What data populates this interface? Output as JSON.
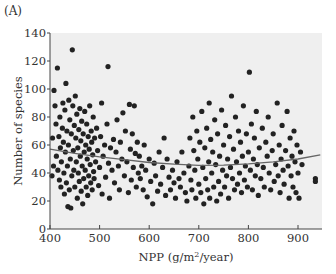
{
  "panel_label": "(A)",
  "chart_data": {
    "type": "scatter",
    "title": "",
    "xlabel": "NPP (g/m²/year)",
    "xlabel_parts": {
      "base": "NPP (g/m",
      "sup": "2",
      "rest": "/year)"
    },
    "ylabel": "Number of species",
    "xlim": [
      400,
      950
    ],
    "ylim": [
      0,
      140
    ],
    "xticks": [
      400,
      500,
      600,
      700,
      800,
      900
    ],
    "yticks": [
      0,
      20,
      40,
      60,
      80,
      100,
      120,
      140
    ],
    "grid": false,
    "legend": null,
    "plot_background": "#efefef",
    "point_color": "#222222",
    "trend_line": {
      "color": "#666666",
      "description": "quadratic fit",
      "points": [
        [
          400,
          57
        ],
        [
          450,
          54
        ],
        [
          500,
          51.5
        ],
        [
          550,
          49.5
        ],
        [
          600,
          47.5
        ],
        [
          650,
          46.3
        ],
        [
          700,
          45.5
        ],
        [
          750,
          45.6
        ],
        [
          800,
          46.5
        ],
        [
          850,
          48
        ],
        [
          900,
          50
        ],
        [
          945,
          53
        ]
      ]
    },
    "series": [
      {
        "name": "sites",
        "points": [
          [
            404,
            38
          ],
          [
            405,
            65
          ],
          [
            407,
            45
          ],
          [
            408,
            99
          ],
          [
            410,
            88
          ],
          [
            412,
            75
          ],
          [
            413,
            52
          ],
          [
            415,
            115
          ],
          [
            416,
            42
          ],
          [
            418,
            66
          ],
          [
            419,
            35
          ],
          [
            420,
            80
          ],
          [
            421,
            58
          ],
          [
            422,
            30
          ],
          [
            423,
            48
          ],
          [
            425,
            72
          ],
          [
            426,
            90
          ],
          [
            427,
            62
          ],
          [
            428,
            40
          ],
          [
            429,
            25
          ],
          [
            430,
            85
          ],
          [
            431,
            55
          ],
          [
            432,
            104
          ],
          [
            433,
            33
          ],
          [
            434,
            70
          ],
          [
            435,
            45
          ],
          [
            436,
            16
          ],
          [
            437,
            60
          ],
          [
            438,
            92
          ],
          [
            439,
            28
          ],
          [
            440,
            78
          ],
          [
            441,
            50
          ],
          [
            442,
            15
          ],
          [
            443,
            68
          ],
          [
            444,
            38
          ],
          [
            445,
            128
          ],
          [
            446,
            88
          ],
          [
            447,
            56
          ],
          [
            448,
            42
          ],
          [
            449,
            74
          ],
          [
            450,
            30
          ],
          [
            451,
            95
          ],
          [
            452,
            65
          ],
          [
            453,
            48
          ],
          [
            454,
            82
          ],
          [
            455,
            22
          ],
          [
            456,
            58
          ],
          [
            457,
            40
          ],
          [
            458,
            71
          ],
          [
            459,
            34
          ],
          [
            460,
            86
          ],
          [
            461,
            52
          ],
          [
            462,
            63
          ],
          [
            463,
            27
          ],
          [
            464,
            77
          ],
          [
            465,
            45
          ],
          [
            466,
            18
          ],
          [
            467,
            68
          ],
          [
            468,
            36
          ],
          [
            469,
            55
          ],
          [
            470,
            84
          ],
          [
            471,
            42
          ],
          [
            472,
            60
          ],
          [
            473,
            30
          ],
          [
            474,
            75
          ],
          [
            475,
            50
          ],
          [
            476,
            24
          ],
          [
            477,
            66
          ],
          [
            478,
            38
          ],
          [
            479,
            57
          ],
          [
            480,
            88
          ],
          [
            481,
            46
          ],
          [
            482,
            33
          ],
          [
            483,
            70
          ],
          [
            484,
            62
          ],
          [
            485,
            28
          ],
          [
            486,
            53
          ],
          [
            487,
            80
          ],
          [
            488,
            41
          ],
          [
            489,
            36
          ],
          [
            490,
            65
          ],
          [
            492,
            48
          ],
          [
            494,
            72
          ],
          [
            496,
            56
          ],
          [
            498,
            31
          ],
          [
            500,
            44
          ],
          [
            502,
            66
          ],
          [
            504,
            90
          ],
          [
            505,
            25
          ],
          [
            507,
            52
          ],
          [
            510,
            60
          ],
          [
            512,
            37
          ],
          [
            515,
            75
          ],
          [
            517,
            116
          ],
          [
            518,
            47
          ],
          [
            520,
            22
          ],
          [
            522,
            58
          ],
          [
            525,
            42
          ],
          [
            528,
            64
          ],
          [
            530,
            33
          ],
          [
            533,
            55
          ],
          [
            535,
            78
          ],
          [
            538,
            45
          ],
          [
            540,
            28
          ],
          [
            542,
            62
          ],
          [
            545,
            50
          ],
          [
            547,
            83
          ],
          [
            550,
            38
          ],
          [
            552,
            70
          ],
          [
            555,
            48
          ],
          [
            558,
            26
          ],
          [
            560,
            89
          ],
          [
            562,
            57
          ],
          [
            564,
            35
          ],
          [
            566,
            68
          ],
          [
            568,
            44
          ],
          [
            570,
            88
          ],
          [
            572,
            54
          ],
          [
            574,
            30
          ],
          [
            576,
            62
          ],
          [
            578,
            40
          ],
          [
            580,
            52
          ],
          [
            582,
            36
          ],
          [
            585,
            45
          ],
          [
            588,
            28
          ],
          [
            590,
            60
          ],
          [
            593,
            42
          ],
          [
            596,
            23
          ],
          [
            600,
            50
          ],
          [
            603,
            34
          ],
          [
            607,
            18
          ],
          [
            610,
            47
          ],
          [
            613,
            38
          ],
          [
            617,
            27
          ],
          [
            620,
            55
          ],
          [
            623,
            32
          ],
          [
            627,
            44
          ],
          [
            630,
            65
          ],
          [
            633,
            24
          ],
          [
            636,
            50
          ],
          [
            640,
            37
          ],
          [
            643,
            28
          ],
          [
            647,
            42
          ],
          [
            650,
            33
          ],
          [
            653,
            22
          ],
          [
            656,
            48
          ],
          [
            660,
            36
          ],
          [
            663,
            30
          ],
          [
            666,
            55
          ],
          [
            670,
            40
          ],
          [
            673,
            26
          ],
          [
            676,
            20
          ],
          [
            680,
            45
          ],
          [
            682,
            65
          ],
          [
            684,
            35
          ],
          [
            686,
            28
          ],
          [
            688,
            80
          ],
          [
            690,
            56
          ],
          [
            692,
            42
          ],
          [
            694,
            22
          ],
          [
            696,
            70
          ],
          [
            698,
            50
          ],
          [
            700,
            32
          ],
          [
            702,
            62
          ],
          [
            704,
            26
          ],
          [
            706,
            84
          ],
          [
            708,
            44
          ],
          [
            710,
            18
          ],
          [
            712,
            58
          ],
          [
            714,
            36
          ],
          [
            716,
            72
          ],
          [
            718,
            28
          ],
          [
            720,
            48
          ],
          [
            721,
            90
          ],
          [
            722,
            22
          ],
          [
            724,
            64
          ],
          [
            726,
            40
          ],
          [
            728,
            55
          ],
          [
            730,
            30
          ],
          [
            732,
            78
          ],
          [
            734,
            46
          ],
          [
            736,
            20
          ],
          [
            738,
            68
          ],
          [
            740,
            34
          ],
          [
            742,
            52
          ],
          [
            744,
            25
          ],
          [
            746,
            85
          ],
          [
            748,
            42
          ],
          [
            750,
            60
          ],
          [
            752,
            30
          ],
          [
            754,
            74
          ],
          [
            756,
            38
          ],
          [
            758,
            50
          ],
          [
            760,
            22
          ],
          [
            762,
            66
          ],
          [
            764,
            44
          ],
          [
            766,
            95
          ],
          [
            768,
            36
          ],
          [
            770,
            57
          ],
          [
            772,
            28
          ],
          [
            774,
            80
          ],
          [
            776,
            48
          ],
          [
            778,
            32
          ],
          [
            780,
            70
          ],
          [
            782,
            40
          ],
          [
            784,
            62
          ],
          [
            786,
            26
          ],
          [
            788,
            52
          ],
          [
            790,
            88
          ],
          [
            792,
            35
          ],
          [
            794,
            45
          ],
          [
            796,
            68
          ],
          [
            798,
            30
          ],
          [
            800,
            55
          ],
          [
            802,
            112
          ],
          [
            804,
            42
          ],
          [
            806,
            75
          ],
          [
            808,
            28
          ],
          [
            810,
            50
          ],
          [
            812,
            65
          ],
          [
            814,
            38
          ],
          [
            816,
            84
          ],
          [
            818,
            46
          ],
          [
            820,
            24
          ],
          [
            822,
            58
          ],
          [
            825,
            36
          ],
          [
            828,
            72
          ],
          [
            830,
            44
          ],
          [
            832,
            30
          ],
          [
            835,
            62
          ],
          [
            838,
            52
          ],
          [
            840,
            80
          ],
          [
            842,
            40
          ],
          [
            845,
            28
          ],
          [
            848,
            56
          ],
          [
            850,
            68
          ],
          [
            852,
            34
          ],
          [
            855,
            46
          ],
          [
            858,
            90
          ],
          [
            860,
            38
          ],
          [
            862,
            60
          ],
          [
            864,
            26
          ],
          [
            866,
            50
          ],
          [
            868,
            74
          ],
          [
            870,
            42
          ],
          [
            872,
            32
          ],
          [
            875,
            56
          ],
          [
            878,
            84
          ],
          [
            880,
            45
          ],
          [
            882,
            22
          ],
          [
            884,
            65
          ],
          [
            886,
            38
          ],
          [
            888,
            52
          ],
          [
            890,
            30
          ],
          [
            892,
            70
          ],
          [
            894,
            48
          ],
          [
            896,
            26
          ],
          [
            898,
            60
          ],
          [
            900,
            40
          ],
          [
            902,
            22
          ],
          [
            905,
            55
          ],
          [
            908,
            46
          ],
          [
            935,
            36
          ],
          [
            935,
            34
          ]
        ]
      }
    ]
  }
}
